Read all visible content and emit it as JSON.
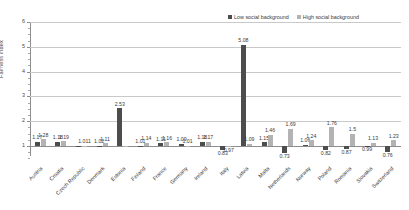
{
  "chart_data": {
    "type": "bar",
    "title": "",
    "xlabel": "",
    "ylabel": "Fairness index",
    "ylim": [
      0.5,
      6
    ],
    "grid": true,
    "legend_position": "top-right",
    "categories": [
      "Austria",
      "Croatia",
      "Czech Republic",
      "Denmark",
      "Estonia",
      "Finland",
      "France",
      "Germany",
      "Ireland",
      "Italy",
      "Latvia",
      "Malta",
      "Netherlands",
      "Norway",
      "Poland",
      "Romania",
      "Slovakia",
      "Switzerland"
    ],
    "series": [
      {
        "name": "Low social background",
        "color": "#4d4d4d",
        "values": [
          1.17,
          1.18,
          1.011,
          1.02,
          2.53,
          1.01,
          1.11,
          1.09,
          1.18,
          0.83,
          5.08,
          1.15,
          1.06,
          1.76,
          0.82,
          0.99,
          1.13,
          0.76
        ]
      },
      {
        "name": "High social background",
        "color": "#b3b3b3",
        "values": [
          1.28,
          1.19,
          1.011,
          1.11,
          2.53,
          1.14,
          1.16,
          1.01,
          1.17,
          0.97,
          5.08,
          1.46,
          1.24,
          1.5,
          0.87,
          0.99,
          1.23,
          0.95
        ]
      }
    ],
    "value_labels_above": [
      "1.17",
      "1.28",
      "1.18",
      "1.19",
      "1.011",
      "1.02",
      "1.11",
      "2.53",
      "1.01",
      "1.14",
      "1.11",
      "1.16",
      "1.09",
      "1.01",
      "1.18",
      "1.17",
      "1.09",
      "5.08",
      "1.15",
      "1.46",
      "1.69",
      "1.06",
      "1.24",
      "1.76",
      "1.5",
      "1.13",
      "1.23"
    ],
    "value_labels_below": [
      "0.97",
      "0.83",
      "0.73",
      "0.82",
      "0.87",
      "0.99",
      "0.95",
      "0.76"
    ],
    "y_ticks": [
      "1",
      "2",
      "3",
      "4",
      "5",
      "6"
    ]
  },
  "y_axis": {
    "title": "Fairness index",
    "ticks": [
      "1",
      "2",
      "3",
      "4",
      "5",
      "6"
    ]
  },
  "legend": {
    "items": [
      {
        "label": "Low social background",
        "color": "#4d4d4d"
      },
      {
        "label": "High social background",
        "color": "#b3b3b3"
      }
    ]
  },
  "bars": [
    {
      "country": "Austria",
      "low": 1.17,
      "high": 1.28,
      "low_label": "1.17",
      "high_label": "1.28"
    },
    {
      "country": "Croatia",
      "low": 1.18,
      "high": 1.19,
      "low_label": "1.18",
      "high_label": "1.19"
    },
    {
      "country": "Czech Republic",
      "low": 1.011,
      "high": 1.011,
      "low_label": "",
      "high_label": "1.011"
    },
    {
      "country": "Denmark",
      "low": 1.02,
      "high": 1.11,
      "low_label": "1.02",
      "high_label": "1.11"
    },
    {
      "country": "Estonia",
      "low": 2.53,
      "high": 1.01,
      "low_label": "2.53",
      "high_label": ""
    },
    {
      "country": "Finland",
      "low": 1.01,
      "high": 1.14,
      "low_label": "1.01",
      "high_label": "1.14"
    },
    {
      "country": "France",
      "low": 1.11,
      "high": 1.16,
      "low_label": "1.11",
      "high_label": "1.16"
    },
    {
      "country": "Germany",
      "low": 1.09,
      "high": 1.01,
      "low_label": "1.09",
      "high_label": "1.01"
    },
    {
      "country": "Ireland",
      "low": 1.18,
      "high": 1.17,
      "low_label": "1.18",
      "high_label": "1.17"
    },
    {
      "country": "Italy",
      "low": 0.83,
      "high": 0.97,
      "low_label": "0.83",
      "high_label": "0.97"
    },
    {
      "country": "Latvia",
      "low": 5.08,
      "high": 1.09,
      "low_label": "5.08",
      "high_label": "1.09"
    },
    {
      "country": "Malta",
      "low": 1.15,
      "high": 1.46,
      "low_label": "1.15",
      "high_label": "1.46"
    },
    {
      "country": "Netherlands",
      "low": 0.73,
      "high": 1.69,
      "low_label": "0.73",
      "high_label": "1.69"
    },
    {
      "country": "Norway",
      "low": 1.06,
      "high": 1.24,
      "low_label": "1.06",
      "high_label": "1.24"
    },
    {
      "country": "Poland",
      "low": 0.82,
      "high": 1.76,
      "low_label": "0.82",
      "high_label": "1.76"
    },
    {
      "country": "Romania",
      "low": 0.87,
      "high": 1.5,
      "low_label": "0.87",
      "high_label": "1.5"
    },
    {
      "country": "Slovakia",
      "low": 0.99,
      "high": 1.13,
      "low_label": "0.99",
      "high_label": "1.13"
    },
    {
      "country": "Switzerland",
      "low": 0.76,
      "high": 1.23,
      "low_label": "0.76",
      "high_label": "1.23"
    }
  ]
}
